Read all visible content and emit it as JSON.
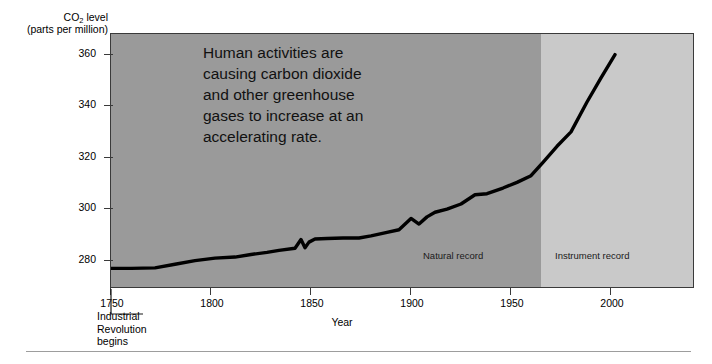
{
  "figure": {
    "annotation": [
      "Human activities are",
      "causing carbon dioxide",
      "and other greenhouse",
      "gases to increase at an",
      "accelerating rate."
    ],
    "callout": {
      "lines": [
        "Industrial",
        "Revolution",
        "begins"
      ],
      "anchor_year": 1750
    },
    "colors": {
      "band_natural": "#9a9a9a",
      "band_instrument": "#c9c9c9",
      "line": "#000000",
      "frame": "#3a3a3a",
      "rule": "#9d9d9d",
      "background": "#ffffff"
    }
  },
  "chart_data": {
    "type": "line",
    "title": "",
    "ylabel_line1": "CO2 level",
    "ylabel_line1_pre": "CO",
    "ylabel_line1_sub": "2",
    "ylabel_line1_post": " level",
    "ylabel_line2": "(parts per million)",
    "xlabel": "Year",
    "xlim": [
      1750,
      2042
    ],
    "ylim": [
      269,
      368
    ],
    "grid": false,
    "legend": "none",
    "xticks": [
      1750,
      1800,
      1850,
      1900,
      1950,
      2000
    ],
    "xticklabels": [
      "1750",
      "1800",
      "1850",
      "1900",
      "1950",
      "2000"
    ],
    "yticks": [
      280,
      300,
      320,
      340,
      360
    ],
    "yticklabels": [
      "280",
      "300",
      "320",
      "340",
      "360"
    ],
    "bands": [
      {
        "label": "Natural record",
        "x_start": 1750,
        "x_end": 1965
      },
      {
        "label": "Instrument record",
        "x_start": 1965,
        "x_end": 2042
      }
    ],
    "series": [
      {
        "name": "Atmospheric CO2 concentration",
        "x": [
          1750,
          1760,
          1772,
          1782,
          1792,
          1802,
          1812,
          1820,
          1828,
          1834,
          1842,
          1845,
          1847,
          1849,
          1852,
          1858,
          1866,
          1874,
          1880,
          1888,
          1894,
          1900,
          1904,
          1908,
          1912,
          1918,
          1925,
          1932,
          1938,
          1946,
          1953,
          1960,
          1966,
          1973,
          1980,
          1988,
          1995,
          2002
        ],
        "y": [
          277.0,
          277.0,
          277.2,
          278.6,
          280.0,
          281.0,
          281.4,
          282.4,
          283.2,
          284.0,
          284.8,
          288.2,
          285.0,
          287.2,
          288.4,
          288.6,
          288.8,
          288.8,
          289.6,
          291.0,
          292.0,
          296.4,
          294.2,
          297.0,
          298.8,
          300.0,
          302.0,
          305.6,
          306.0,
          308.2,
          310.4,
          313.0,
          318.2,
          324.4,
          330.0,
          341.6,
          351.0,
          360.0
        ]
      }
    ]
  }
}
